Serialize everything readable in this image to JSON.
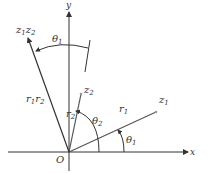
{
  "diagram": {
    "title": "",
    "labels": {
      "y_axis": "y",
      "x_axis": "x",
      "origin": "O",
      "z1": "z",
      "z1_sub": "1",
      "z2": "z",
      "z2_sub": "2",
      "z1z2_a": "z",
      "z1z2_a_sub": "1",
      "z1z2_b": "z",
      "z1z2_b_sub": "2",
      "r1": "r",
      "r1_sub": "1",
      "r2": "r",
      "r2_sub": "2",
      "r1r2_a": "r",
      "r1r2_a_sub": "1",
      "r1r2_b": "r",
      "r1r2_b_sub": "2",
      "theta1_top": "θ",
      "theta1_top_sub": "1",
      "theta2": "θ",
      "theta2_sub": "2",
      "theta1_bottom": "θ",
      "theta1_bottom_sub": "1"
    },
    "colors": {
      "line": "#333333",
      "vector_z1_z2": "#555555",
      "background": "#ffffff"
    }
  }
}
